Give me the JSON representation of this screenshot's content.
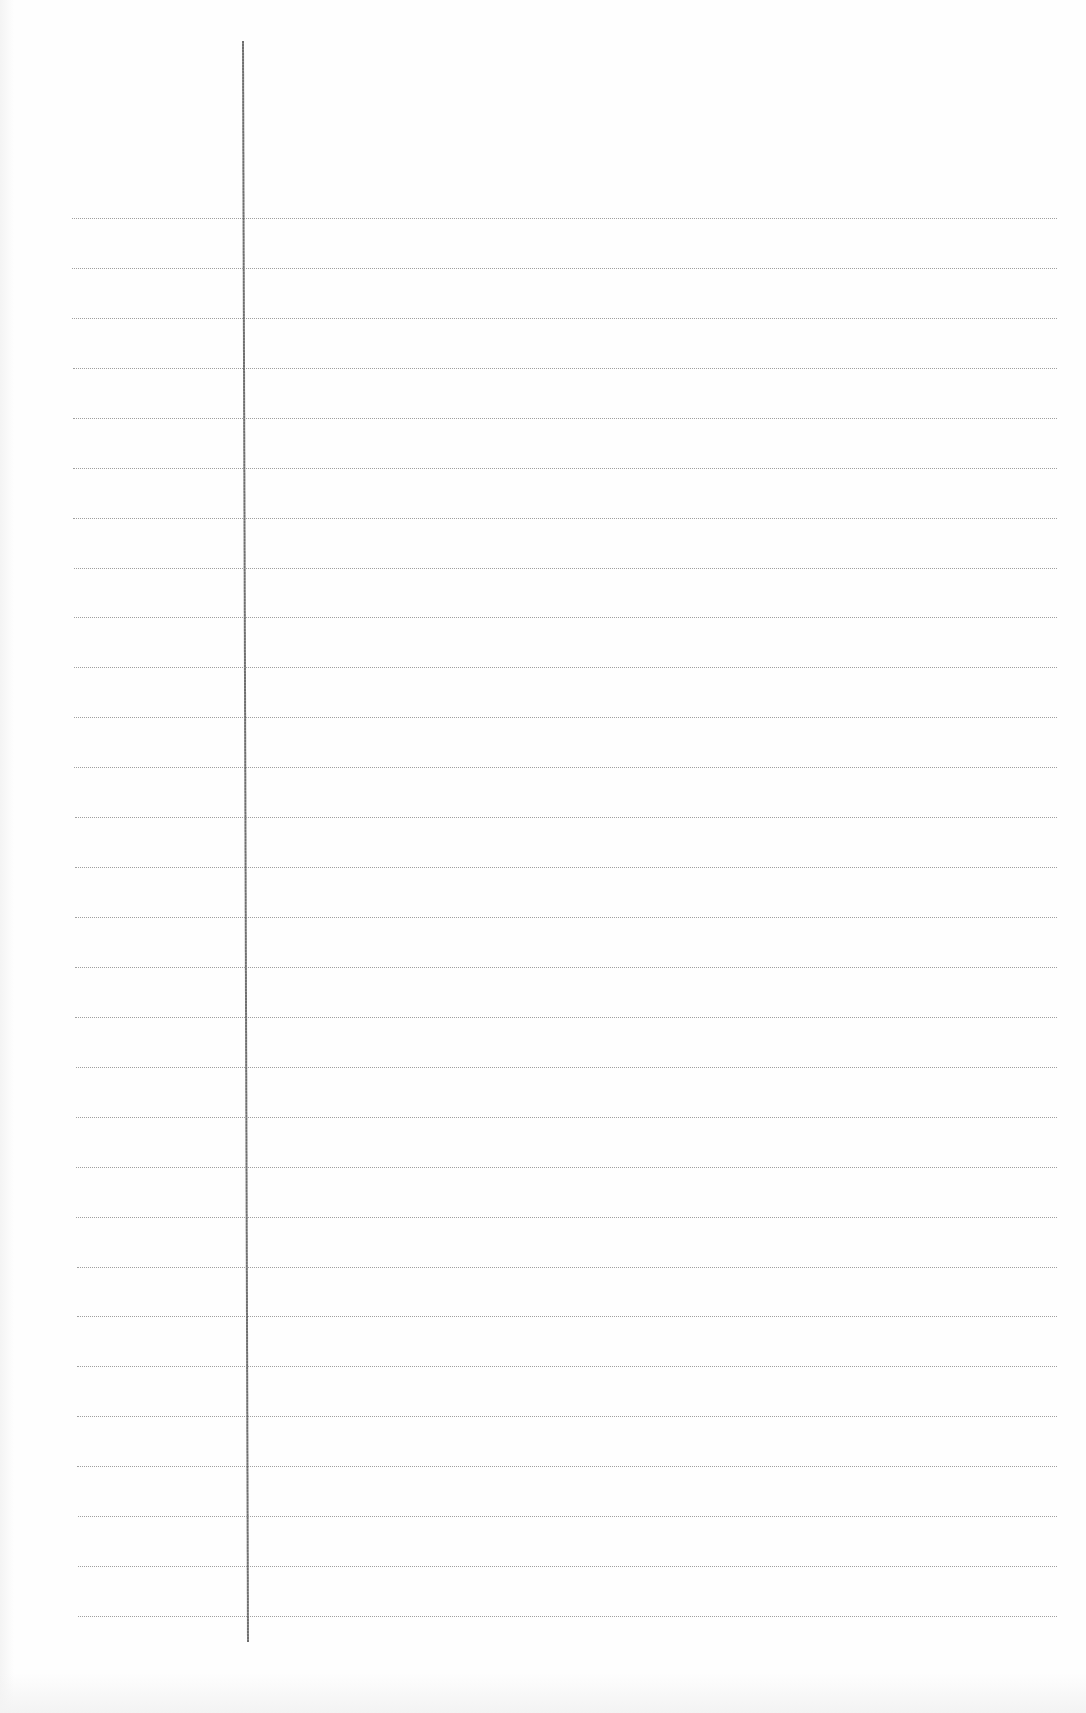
{
  "document": {
    "type": "lined-notebook-paper",
    "background_color": "#fefefe",
    "rule_color": "#8f8f8f",
    "margin_line_color": "#6e6e6e"
  },
  "margin_line": {
    "x_top": 242,
    "y_top": 41,
    "x_bottom": 247,
    "y_bottom": 1642
  },
  "rules": {
    "count": 29,
    "first_y": 218,
    "spacing": 49.93,
    "x_start_top": 72,
    "x_start_bottom": 78,
    "x_end": 1057
  }
}
